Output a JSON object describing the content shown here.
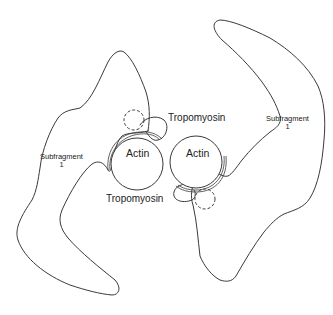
{
  "diagram": {
    "labels": {
      "actin_left": "Actin",
      "actin_right": "Actin",
      "tropomyosin_top": "Tropomyosin",
      "tropomyosin_bottom": "Tropomyosin",
      "subfragment_left": "Subfragment",
      "subfragment_left_num": "1",
      "subfragment_right": "Subfragment",
      "subfragment_right_num": "1"
    },
    "colors": {
      "stroke": "#3a3a3a",
      "background": "#ffffff"
    }
  }
}
